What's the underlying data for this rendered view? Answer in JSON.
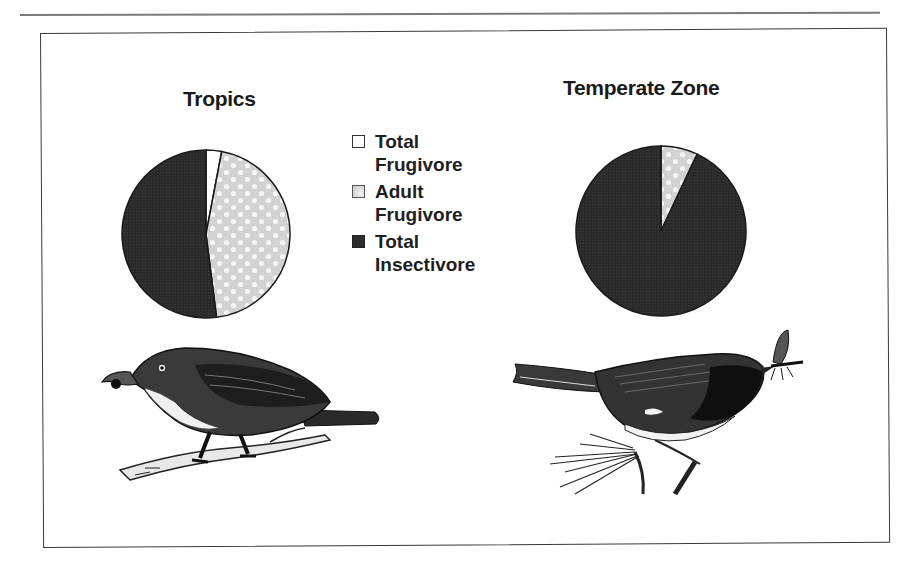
{
  "figure": {
    "left_title": "Tropics",
    "right_title": "Temperate Zone",
    "legend": [
      {
        "line1": "Total",
        "line2": "Frugivore",
        "swatch": "white",
        "color": "#ffffff"
      },
      {
        "line1": "Adult",
        "line2": "Frugivore",
        "swatch": "dotted",
        "color": "#d4d4d4"
      },
      {
        "line1": "Total",
        "line2": "Insectivore",
        "swatch": "dark",
        "color": "#2c2c2c"
      }
    ],
    "illustrations": [
      {
        "name": "frugivore-bird",
        "description": "Tropical fruit-eating bird perched on a branch, holding a fruit in its beak"
      },
      {
        "name": "insectivore-bird",
        "description": "Temperate insect-eating bird perched on a twig, holding a moth in its beak"
      }
    ]
  },
  "chart_data": [
    {
      "type": "pie",
      "title": "Tropics",
      "categories": [
        "Total Frugivore",
        "Adult Frugivore",
        "Total Insectivore"
      ],
      "values": [
        3,
        45,
        52
      ],
      "colors": [
        "#ffffff",
        "#d4d4d4",
        "#2c2c2c"
      ],
      "start_angle_deg": 0,
      "direction": "clockwise",
      "legend_position": "center-between-pies"
    },
    {
      "type": "pie",
      "title": "Temperate Zone",
      "categories": [
        "Total Frugivore",
        "Adult Frugivore",
        "Total Insectivore"
      ],
      "values": [
        0,
        7,
        93
      ],
      "colors": [
        "#ffffff",
        "#d4d4d4",
        "#2c2c2c"
      ],
      "start_angle_deg": 0,
      "direction": "clockwise",
      "legend_position": "center-between-pies"
    }
  ]
}
